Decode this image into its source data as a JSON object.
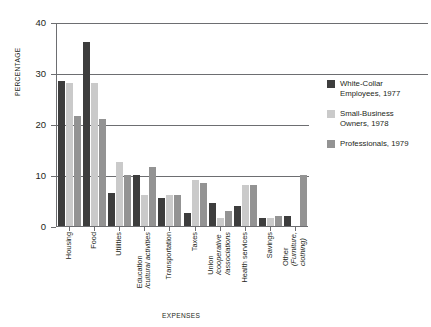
{
  "chart_data": {
    "type": "bar",
    "title": "",
    "xlabel": "EXPENSES",
    "ylabel": "PERCENTAGE",
    "ylim": [
      0,
      40
    ],
    "yticks": [
      0,
      10,
      20,
      30,
      40
    ],
    "grid": true,
    "legend_position": "right",
    "categories": [
      "Housing",
      "Food",
      "Utilities",
      "Education /cultural activities",
      "Transportation",
      "Taxes",
      "Union /cooperative /associations",
      "Health services",
      "Savings",
      "Other (Furniture, clothing)"
    ],
    "category_lines": [
      [
        "Housing"
      ],
      [
        "Food"
      ],
      [
        "Utilities"
      ],
      [
        "Education",
        "/cultural activities"
      ],
      [
        "Transportation"
      ],
      [
        "Taxes"
      ],
      [
        "Union",
        "/cooperative",
        "/associations"
      ],
      [
        "Health services"
      ],
      [
        "Savings"
      ],
      [
        "Other",
        "(Furniture,",
        "clothing)"
      ]
    ],
    "series": [
      {
        "name": "White-Collar Employees, 1977",
        "name_lines": [
          "White-Collar",
          "Employees, 1977"
        ],
        "color": "#3d3d3d",
        "values": [
          28.5,
          36,
          6.5,
          10,
          5.5,
          2.5,
          4.5,
          4,
          1.5,
          2
        ]
      },
      {
        "name": "Small-Business Owners, 1978",
        "name_lines": [
          "Small-Business",
          "Owners, 1978"
        ],
        "color": "#cacaca",
        "values": [
          28,
          28,
          12.5,
          6,
          6,
          9,
          1.5,
          8,
          1.5,
          0
        ]
      },
      {
        "name": "Professionals, 1979",
        "name_lines": [
          "Professionals, 1979"
        ],
        "color": "#939393",
        "values": [
          21.5,
          21,
          10,
          11.5,
          6,
          8.5,
          3,
          8,
          2,
          10
        ]
      }
    ]
  },
  "colors": {
    "axis": "#6d6e71",
    "text": "#231f20",
    "background": "#ffffff"
  }
}
